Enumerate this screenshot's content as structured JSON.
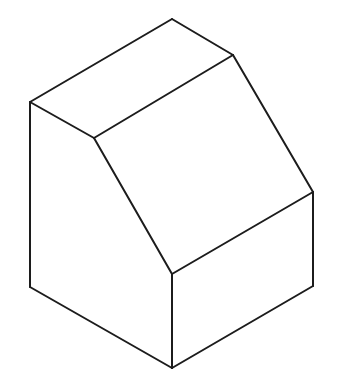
{
  "figure": {
    "stroke_color": "#1c1c1c",
    "stroke_width": 2,
    "background": "#ffffff"
  },
  "vertices": {
    "apex": [
      172,
      19
    ],
    "top_right": [
      233,
      55
    ],
    "left_top": [
      30,
      102
    ],
    "inner_top": [
      94,
      138
    ],
    "right_mid": [
      313,
      192
    ],
    "front_top": [
      172,
      274
    ],
    "left_bottom": [
      30,
      287
    ],
    "right_bottom": [
      313,
      286
    ],
    "bottom": [
      172,
      368
    ]
  },
  "edges": [
    [
      "apex",
      "top_right"
    ],
    [
      "apex",
      "left_top"
    ],
    [
      "left_top",
      "inner_top"
    ],
    [
      "inner_top",
      "top_right"
    ],
    [
      "top_right",
      "right_mid"
    ],
    [
      "inner_top",
      "front_top"
    ],
    [
      "front_top",
      "right_mid"
    ],
    [
      "left_top",
      "left_bottom"
    ],
    [
      "left_bottom",
      "bottom"
    ],
    [
      "front_top",
      "bottom"
    ],
    [
      "bottom",
      "right_bottom"
    ],
    [
      "right_mid",
      "right_bottom"
    ]
  ]
}
